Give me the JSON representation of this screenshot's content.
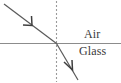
{
  "diagram": {
    "type": "optics-ray-diagram",
    "canvas": {
      "width": 121,
      "height": 83,
      "background": "#ffffff"
    },
    "labels": {
      "air": "Air",
      "glass": "Glass"
    },
    "colors": {
      "ray": "#595959",
      "interface": "#8c8c8c",
      "normal": "#9a9a9a",
      "text": "#3a3a3a",
      "background": "#ffffff"
    },
    "geometry": {
      "incidence_point": {
        "x": 56,
        "y": 43
      },
      "incident_ray": {
        "x1": 5,
        "y1": 5,
        "x2": 56,
        "y2": 43,
        "arrow_at": {
          "x": 31,
          "y": 24
        }
      },
      "refracted_ray": {
        "x1": 56,
        "y1": 43,
        "x2": 78,
        "y2": 81,
        "arrow_at": {
          "x": 71,
          "y": 69
        }
      },
      "interface_line": {
        "x1": 0,
        "y1": 43,
        "x2": 121,
        "y2": 43
      },
      "normal_line": {
        "x": 56,
        "y1": 1,
        "y2": 82,
        "dash": "2 2"
      }
    },
    "elements": {
      "incident_ray_name": "incident-ray",
      "refracted_ray_name": "refracted-ray",
      "normal_name": "normal-line",
      "interface_name": "interface-line"
    }
  }
}
